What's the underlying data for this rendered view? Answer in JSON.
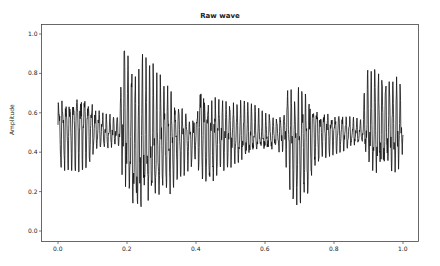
{
  "chart_data": {
    "type": "line",
    "title": "Raw wave",
    "xlabel": "",
    "ylabel": "Amplitude",
    "xlim": [
      -0.05,
      1.05
    ],
    "ylim": [
      -0.05,
      1.05
    ],
    "grid": false,
    "legend": null,
    "x_ticks": [
      "0.0",
      "0.2",
      "0.4",
      "0.6",
      "0.8",
      "1.0"
    ],
    "y_ticks": [
      "0.0",
      "0.2",
      "0.4",
      "0.6",
      "0.8",
      "1.0"
    ],
    "line_color": "#000000",
    "series": [
      {
        "name": "Raw wave",
        "description": "Normalized audio waveform oscillating around 0.5; envelope given as [x, upper, lower]",
        "envelope": [
          [
            0.0,
            0.72,
            0.3
          ],
          [
            0.03,
            0.7,
            0.31
          ],
          [
            0.06,
            0.74,
            0.3
          ],
          [
            0.09,
            0.72,
            0.33
          ],
          [
            0.11,
            0.64,
            0.4
          ],
          [
            0.13,
            0.6,
            0.4
          ],
          [
            0.16,
            0.59,
            0.42
          ],
          [
            0.179,
            0.6,
            0.42
          ],
          [
            0.185,
            0.86,
            0.27
          ],
          [
            0.195,
            1.0,
            0.15
          ],
          [
            0.21,
            0.84,
            0.11
          ],
          [
            0.22,
            0.85,
            0.01
          ],
          [
            0.23,
            0.8,
            0.0
          ],
          [
            0.25,
            0.93,
            0.07
          ],
          [
            0.27,
            0.87,
            0.05
          ],
          [
            0.29,
            0.8,
            0.1
          ],
          [
            0.31,
            0.78,
            0.18
          ],
          [
            0.33,
            0.74,
            0.19
          ],
          [
            0.35,
            0.68,
            0.25
          ],
          [
            0.38,
            0.62,
            0.31
          ],
          [
            0.4,
            0.6,
            0.36
          ],
          [
            0.41,
            0.78,
            0.26
          ],
          [
            0.43,
            0.75,
            0.2
          ],
          [
            0.46,
            0.7,
            0.26
          ],
          [
            0.48,
            0.68,
            0.3
          ],
          [
            0.51,
            0.68,
            0.3
          ],
          [
            0.54,
            0.66,
            0.34
          ],
          [
            0.57,
            0.64,
            0.36
          ],
          [
            0.6,
            0.6,
            0.38
          ],
          [
            0.63,
            0.58,
            0.4
          ],
          [
            0.655,
            0.6,
            0.4
          ],
          [
            0.665,
            0.77,
            0.28
          ],
          [
            0.68,
            0.74,
            0.12
          ],
          [
            0.7,
            0.76,
            0.14
          ],
          [
            0.72,
            0.74,
            0.15
          ],
          [
            0.74,
            0.68,
            0.3
          ],
          [
            0.76,
            0.64,
            0.36
          ],
          [
            0.79,
            0.62,
            0.38
          ],
          [
            0.82,
            0.6,
            0.4
          ],
          [
            0.85,
            0.58,
            0.42
          ],
          [
            0.88,
            0.57,
            0.44
          ],
          [
            0.895,
            0.82,
            0.3
          ],
          [
            0.92,
            0.82,
            0.22
          ],
          [
            0.95,
            0.8,
            0.28
          ],
          [
            0.97,
            0.8,
            0.24
          ],
          [
            0.99,
            0.77,
            0.3
          ],
          [
            1.0,
            0.6,
            0.4
          ]
        ]
      }
    ]
  }
}
